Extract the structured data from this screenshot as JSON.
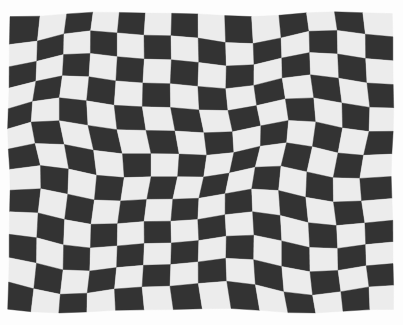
{
  "image": {
    "description": "Black-and-white photograph of a wavy, distorted checkerboard pattern",
    "width": 403,
    "height": 325,
    "background_color": "#fdfdfd"
  },
  "checkerboard": {
    "columns": 14,
    "rows": 13,
    "origin_x": 9,
    "origin_y": 14,
    "cell_width": 27.4,
    "cell_height": 22.8,
    "top_left_is_dark": true,
    "dark_color": "#333333",
    "light_color": "#ececec",
    "distortion": {
      "horizontal_waves": [
        {
          "amplitude": 5.5,
          "wavelength": 230,
          "phase": 1.2
        },
        {
          "amplitude": 2.5,
          "wavelength": 120,
          "phase": 0.4
        }
      ],
      "vertical_waves": [
        {
          "amplitude": 4.0,
          "wavelength": 190,
          "phase": 0.8
        },
        {
          "amplitude": 2.0,
          "wavelength": 95,
          "phase": 2.1
        }
      ]
    }
  }
}
